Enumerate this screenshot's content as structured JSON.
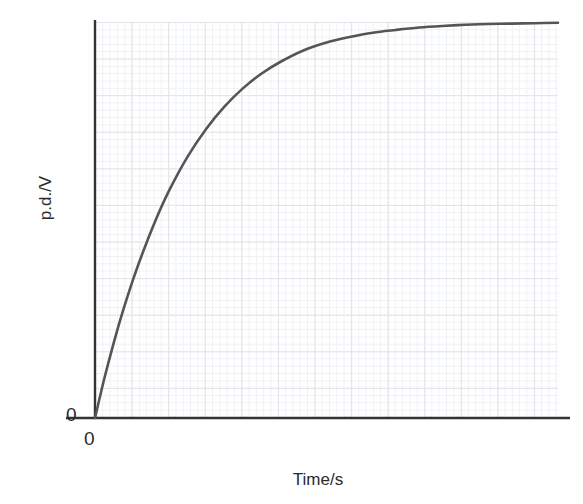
{
  "figure": {
    "name": "capacitor-charging-graph",
    "background_color": "#ffffff"
  },
  "axes": {
    "y_label": "p.d./V",
    "x_label": "Time/s",
    "y_origin_label": "0",
    "x_origin_label": "0",
    "axis_color": "#333333",
    "grid_major_color": "#dfe3ea",
    "grid_minor_color": "#eef1f5"
  },
  "chart_data": {
    "type": "line",
    "title": "",
    "subtitle": "",
    "xlabel": "Time/s",
    "ylabel": "p.d./V",
    "xlim": [
      0,
      1
    ],
    "ylim": [
      0,
      1
    ],
    "grid": true,
    "legend": "none",
    "annotations": [
      "0 marked at origin on the y-axis",
      "0 marked at origin on the x-axis",
      "axes are unscaled / no numeric tick labels"
    ],
    "curve_color": "#555555",
    "series": [
      {
        "name": "p.d. across capacitor",
        "x": [
          0.0,
          0.02,
          0.04,
          0.06,
          0.08,
          0.1,
          0.13,
          0.16,
          0.2,
          0.24,
          0.28,
          0.32,
          0.36,
          0.4,
          0.45,
          0.5,
          0.55,
          0.6,
          0.65,
          0.7,
          0.75,
          0.8,
          0.85,
          0.9,
          0.95,
          1.0
        ],
        "y": [
          0.0,
          0.099,
          0.188,
          0.269,
          0.342,
          0.408,
          0.497,
          0.574,
          0.66,
          0.73,
          0.787,
          0.833,
          0.87,
          0.899,
          0.928,
          0.948,
          0.962,
          0.973,
          0.98,
          0.986,
          0.99,
          0.993,
          0.995,
          0.996,
          0.997,
          0.998
        ],
        "model": "y = 1 - exp(-t/tau), tau = 0.192 of full x-range"
      }
    ]
  },
  "geometry": {
    "origin_px": [
      95,
      418
    ],
    "plot_right_px": 558,
    "plot_top_px": 22,
    "x_axis_end_px": 570,
    "y_axis_top_px": 20
  }
}
